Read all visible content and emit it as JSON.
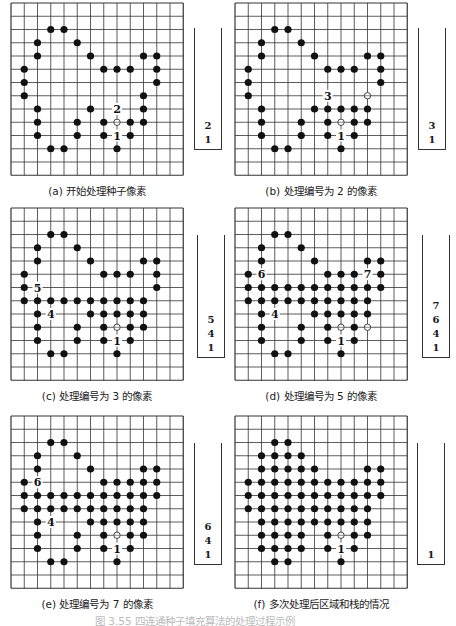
{
  "figure": {
    "grid": {
      "cols": 13,
      "rows": 13,
      "line_color": "#333333",
      "dot_color": "#111111"
    },
    "caption_partial": "图 3.55  四连通种子填充算法的处理过程示例"
  },
  "panels": [
    {
      "id": "a",
      "caption": "(a) 开始处理种子像素",
      "origin": [
        11,
        3
      ],
      "stack_box": [
        194,
        28,
        28,
        122
      ],
      "stack": [
        "2",
        "1"
      ],
      "dots": [
        [
          3,
          2
        ],
        [
          4,
          2
        ],
        [
          2,
          3
        ],
        [
          5,
          3
        ],
        [
          2,
          4
        ],
        [
          6,
          4
        ],
        [
          10,
          4
        ],
        [
          11,
          4
        ],
        [
          1,
          5
        ],
        [
          7,
          5
        ],
        [
          8,
          5
        ],
        [
          9,
          5
        ],
        [
          11,
          5
        ],
        [
          1,
          6
        ],
        [
          11,
          6
        ],
        [
          1,
          7
        ],
        [
          10,
          7
        ],
        [
          2,
          8
        ],
        [
          6,
          8
        ],
        [
          10,
          8
        ],
        [
          2,
          9
        ],
        [
          5,
          9
        ],
        [
          7,
          9
        ],
        [
          9,
          9
        ],
        [
          10,
          9
        ],
        [
          2,
          10
        ],
        [
          5,
          10
        ],
        [
          7,
          10
        ],
        [
          9,
          10
        ],
        [
          3,
          11
        ],
        [
          4,
          11
        ],
        [
          8,
          11
        ]
      ],
      "open": [
        [
          8,
          9
        ]
      ],
      "labels": [
        {
          "col": 8,
          "row": 8,
          "text": "2"
        },
        {
          "col": 8,
          "row": 10,
          "text": "1"
        }
      ]
    },
    {
      "id": "b",
      "caption": "(b) 处理编号为 2 的像素",
      "origin": [
        235,
        3
      ],
      "stack_box": [
        418,
        28,
        28,
        122
      ],
      "stack": [
        "3",
        "1"
      ],
      "dots": [
        [
          3,
          2
        ],
        [
          4,
          2
        ],
        [
          2,
          3
        ],
        [
          5,
          3
        ],
        [
          2,
          4
        ],
        [
          6,
          4
        ],
        [
          10,
          4
        ],
        [
          11,
          4
        ],
        [
          1,
          5
        ],
        [
          7,
          5
        ],
        [
          8,
          5
        ],
        [
          9,
          5
        ],
        [
          11,
          5
        ],
        [
          1,
          6
        ],
        [
          11,
          6
        ],
        [
          1,
          7
        ],
        [
          2,
          8
        ],
        [
          6,
          8
        ],
        [
          7,
          8
        ],
        [
          8,
          8
        ],
        [
          9,
          8
        ],
        [
          10,
          8
        ],
        [
          2,
          9
        ],
        [
          5,
          9
        ],
        [
          7,
          9
        ],
        [
          9,
          9
        ],
        [
          10,
          9
        ],
        [
          2,
          10
        ],
        [
          5,
          10
        ],
        [
          7,
          10
        ],
        [
          9,
          10
        ],
        [
          3,
          11
        ],
        [
          4,
          11
        ],
        [
          8,
          11
        ]
      ],
      "open": [
        [
          8,
          9
        ],
        [
          10,
          7
        ]
      ],
      "labels": [
        {
          "col": 7,
          "row": 7,
          "text": "3"
        },
        {
          "col": 8,
          "row": 10,
          "text": "1"
        }
      ]
    },
    {
      "id": "c",
      "caption": "(c) 处理编号为 3 的像素",
      "origin": [
        11,
        208
      ],
      "stack_box": [
        197,
        235,
        28,
        123
      ],
      "stack": [
        "5",
        "4",
        "1"
      ],
      "dots": [
        [
          3,
          2
        ],
        [
          4,
          2
        ],
        [
          2,
          3
        ],
        [
          5,
          3
        ],
        [
          2,
          4
        ],
        [
          6,
          4
        ],
        [
          10,
          4
        ],
        [
          11,
          4
        ],
        [
          1,
          5
        ],
        [
          7,
          5
        ],
        [
          8,
          5
        ],
        [
          9,
          5
        ],
        [
          11,
          5
        ],
        [
          1,
          6
        ],
        [
          11,
          6
        ],
        [
          1,
          7
        ],
        [
          2,
          7
        ],
        [
          3,
          7
        ],
        [
          4,
          7
        ],
        [
          5,
          7
        ],
        [
          6,
          7
        ],
        [
          7,
          7
        ],
        [
          8,
          7
        ],
        [
          9,
          7
        ],
        [
          10,
          7
        ],
        [
          2,
          8
        ],
        [
          6,
          8
        ],
        [
          7,
          8
        ],
        [
          8,
          8
        ],
        [
          9,
          8
        ],
        [
          10,
          8
        ],
        [
          2,
          9
        ],
        [
          5,
          9
        ],
        [
          7,
          9
        ],
        [
          9,
          9
        ],
        [
          10,
          9
        ],
        [
          2,
          10
        ],
        [
          5,
          10
        ],
        [
          7,
          10
        ],
        [
          9,
          10
        ],
        [
          3,
          11
        ],
        [
          4,
          11
        ],
        [
          8,
          11
        ]
      ],
      "open": [
        [
          8,
          9
        ]
      ],
      "labels": [
        {
          "col": 2,
          "row": 6,
          "text": "5"
        },
        {
          "col": 3,
          "row": 8,
          "text": "4"
        },
        {
          "col": 8,
          "row": 10,
          "text": "1"
        }
      ]
    },
    {
      "id": "d",
      "caption": "(d) 处理编号为 5 的像素",
      "origin": [
        235,
        208
      ],
      "stack_box": [
        422,
        235,
        28,
        123
      ],
      "stack": [
        "7",
        "6",
        "4",
        "1"
      ],
      "dots": [
        [
          3,
          2
        ],
        [
          4,
          2
        ],
        [
          2,
          3
        ],
        [
          5,
          3
        ],
        [
          2,
          4
        ],
        [
          6,
          4
        ],
        [
          10,
          4
        ],
        [
          11,
          4
        ],
        [
          1,
          5
        ],
        [
          7,
          5
        ],
        [
          8,
          5
        ],
        [
          9,
          5
        ],
        [
          11,
          5
        ],
        [
          1,
          6
        ],
        [
          2,
          6
        ],
        [
          3,
          6
        ],
        [
          4,
          6
        ],
        [
          5,
          6
        ],
        [
          6,
          6
        ],
        [
          7,
          6
        ],
        [
          8,
          6
        ],
        [
          9,
          6
        ],
        [
          10,
          6
        ],
        [
          11,
          6
        ],
        [
          1,
          7
        ],
        [
          2,
          7
        ],
        [
          3,
          7
        ],
        [
          4,
          7
        ],
        [
          5,
          7
        ],
        [
          6,
          7
        ],
        [
          7,
          7
        ],
        [
          8,
          7
        ],
        [
          9,
          7
        ],
        [
          10,
          7
        ],
        [
          2,
          8
        ],
        [
          6,
          8
        ],
        [
          7,
          8
        ],
        [
          8,
          8
        ],
        [
          9,
          8
        ],
        [
          10,
          8
        ],
        [
          2,
          9
        ],
        [
          5,
          9
        ],
        [
          7,
          9
        ],
        [
          9,
          9
        ],
        [
          2,
          10
        ],
        [
          5,
          10
        ],
        [
          7,
          10
        ],
        [
          9,
          10
        ],
        [
          3,
          11
        ],
        [
          4,
          11
        ],
        [
          8,
          11
        ]
      ],
      "open": [
        [
          8,
          9
        ],
        [
          10,
          9
        ]
      ],
      "labels": [
        {
          "col": 2,
          "row": 5,
          "text": "6"
        },
        {
          "col": 10,
          "row": 5,
          "text": "7"
        },
        {
          "col": 3,
          "row": 8,
          "text": "4"
        },
        {
          "col": 8,
          "row": 10,
          "text": "1"
        }
      ]
    },
    {
      "id": "e",
      "caption": "(e) 处理编号为 7 的像素",
      "origin": [
        11,
        416
      ],
      "stack_box": [
        194,
        443,
        28,
        122
      ],
      "stack": [
        "6",
        "4",
        "1"
      ],
      "dots": [
        [
          3,
          2
        ],
        [
          4,
          2
        ],
        [
          2,
          3
        ],
        [
          5,
          3
        ],
        [
          2,
          4
        ],
        [
          6,
          4
        ],
        [
          10,
          4
        ],
        [
          11,
          4
        ],
        [
          1,
          5
        ],
        [
          7,
          5
        ],
        [
          8,
          5
        ],
        [
          9,
          5
        ],
        [
          10,
          5
        ],
        [
          11,
          5
        ],
        [
          1,
          6
        ],
        [
          2,
          6
        ],
        [
          3,
          6
        ],
        [
          4,
          6
        ],
        [
          5,
          6
        ],
        [
          6,
          6
        ],
        [
          7,
          6
        ],
        [
          8,
          6
        ],
        [
          9,
          6
        ],
        [
          10,
          6
        ],
        [
          11,
          6
        ],
        [
          1,
          7
        ],
        [
          2,
          7
        ],
        [
          3,
          7
        ],
        [
          4,
          7
        ],
        [
          5,
          7
        ],
        [
          6,
          7
        ],
        [
          7,
          7
        ],
        [
          8,
          7
        ],
        [
          9,
          7
        ],
        [
          10,
          7
        ],
        [
          2,
          8
        ],
        [
          6,
          8
        ],
        [
          7,
          8
        ],
        [
          8,
          8
        ],
        [
          9,
          8
        ],
        [
          10,
          8
        ],
        [
          2,
          9
        ],
        [
          5,
          9
        ],
        [
          7,
          9
        ],
        [
          9,
          9
        ],
        [
          10,
          9
        ],
        [
          2,
          10
        ],
        [
          5,
          10
        ],
        [
          7,
          10
        ],
        [
          9,
          10
        ],
        [
          3,
          11
        ],
        [
          4,
          11
        ],
        [
          8,
          11
        ]
      ],
      "open": [
        [
          8,
          9
        ]
      ],
      "labels": [
        {
          "col": 2,
          "row": 5,
          "text": "6"
        },
        {
          "col": 3,
          "row": 8,
          "text": "4"
        },
        {
          "col": 8,
          "row": 10,
          "text": "1"
        }
      ]
    },
    {
      "id": "f",
      "caption": "(f) 多次处理后区域和栈的情况",
      "origin": [
        235,
        416
      ],
      "stack_box": [
        417,
        443,
        28,
        122
      ],
      "stack": [
        "1"
      ],
      "dots": [
        [
          3,
          2
        ],
        [
          4,
          2
        ],
        [
          2,
          3
        ],
        [
          3,
          3
        ],
        [
          4,
          3
        ],
        [
          5,
          3
        ],
        [
          2,
          4
        ],
        [
          3,
          4
        ],
        [
          4,
          4
        ],
        [
          5,
          4
        ],
        [
          6,
          4
        ],
        [
          10,
          4
        ],
        [
          11,
          4
        ],
        [
          1,
          5
        ],
        [
          2,
          5
        ],
        [
          3,
          5
        ],
        [
          4,
          5
        ],
        [
          5,
          5
        ],
        [
          6,
          5
        ],
        [
          7,
          5
        ],
        [
          8,
          5
        ],
        [
          9,
          5
        ],
        [
          10,
          5
        ],
        [
          11,
          5
        ],
        [
          1,
          6
        ],
        [
          2,
          6
        ],
        [
          3,
          6
        ],
        [
          4,
          6
        ],
        [
          5,
          6
        ],
        [
          6,
          6
        ],
        [
          7,
          6
        ],
        [
          8,
          6
        ],
        [
          9,
          6
        ],
        [
          10,
          6
        ],
        [
          11,
          6
        ],
        [
          1,
          7
        ],
        [
          2,
          7
        ],
        [
          3,
          7
        ],
        [
          4,
          7
        ],
        [
          5,
          7
        ],
        [
          6,
          7
        ],
        [
          7,
          7
        ],
        [
          8,
          7
        ],
        [
          9,
          7
        ],
        [
          10,
          7
        ],
        [
          2,
          8
        ],
        [
          3,
          8
        ],
        [
          4,
          8
        ],
        [
          5,
          8
        ],
        [
          6,
          8
        ],
        [
          7,
          8
        ],
        [
          8,
          8
        ],
        [
          9,
          8
        ],
        [
          10,
          8
        ],
        [
          2,
          9
        ],
        [
          3,
          9
        ],
        [
          4,
          9
        ],
        [
          5,
          9
        ],
        [
          7,
          9
        ],
        [
          9,
          9
        ],
        [
          10,
          9
        ],
        [
          2,
          10
        ],
        [
          3,
          10
        ],
        [
          4,
          10
        ],
        [
          5,
          10
        ],
        [
          7,
          10
        ],
        [
          9,
          10
        ],
        [
          3,
          11
        ],
        [
          4,
          11
        ],
        [
          8,
          11
        ]
      ],
      "open": [
        [
          8,
          9
        ]
      ],
      "labels": [
        {
          "col": 8,
          "row": 10,
          "text": "1"
        }
      ]
    }
  ]
}
